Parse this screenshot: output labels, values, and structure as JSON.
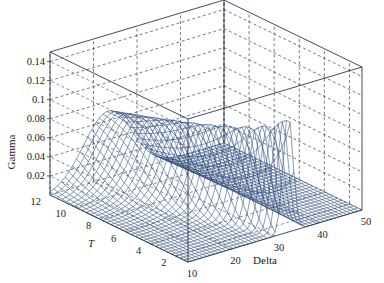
{
  "chart_data": {
    "type": "surface3d",
    "title": "",
    "xlabel": "Delta",
    "ylabel": "T",
    "zlabel": "Gamma",
    "x_ticks": [
      10,
      20,
      30,
      40,
      50
    ],
    "y_ticks": [
      2,
      4,
      6,
      8,
      10,
      12
    ],
    "z_ticks": [
      0.02,
      0.04,
      0.06,
      0.08,
      0.1,
      0.12,
      0.14
    ],
    "xlim": [
      10,
      50
    ],
    "ylim": [
      1,
      12
    ],
    "zlim": [
      0,
      0.15
    ],
    "grid": true,
    "grid_style": "dashed",
    "surface_color": "#2b4a7a",
    "series": [
      {
        "name": "Gamma(T=12)",
        "x": [
          10,
          15,
          20,
          25,
          30,
          35,
          40,
          45,
          50
        ],
        "values": [
          0.0,
          0.005,
          0.04,
          0.065,
          0.06,
          0.03,
          0.005,
          0.0,
          0.0
        ]
      },
      {
        "name": "Gamma(T=6)",
        "x": [
          10,
          15,
          20,
          25,
          30,
          35,
          40,
          45,
          50
        ],
        "values": [
          0.0,
          0.0,
          0.015,
          0.06,
          0.07,
          0.035,
          0.005,
          0.0,
          0.0
        ]
      },
      {
        "name": "Gamma(T=1)",
        "x": [
          10,
          15,
          20,
          25,
          30,
          35,
          40,
          45,
          50
        ],
        "values": [
          0.0,
          0.0,
          0.0,
          0.005,
          0.06,
          0.12,
          0.01,
          0.0,
          0.0
        ]
      }
    ]
  },
  "axes": {
    "z_label": "Gamma",
    "y_label": "T",
    "x_label": "Delta",
    "z_tick_labels": [
      "0.14",
      "0.12",
      "0.1",
      "0.08",
      "0.06",
      "0.04",
      "0.02"
    ],
    "y_tick_labels": [
      "12",
      "10",
      "8",
      "6",
      "4",
      "2"
    ],
    "x_tick_labels": [
      "10",
      "20",
      "30",
      "40",
      "50"
    ]
  }
}
